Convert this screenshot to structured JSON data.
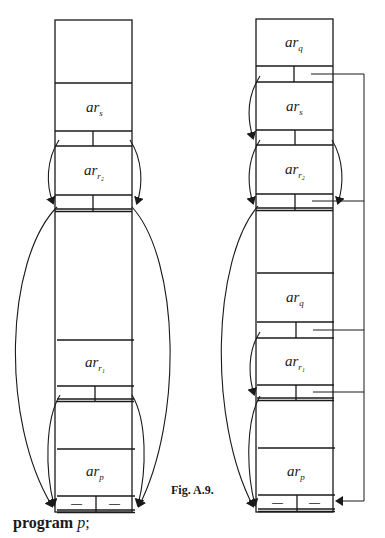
{
  "figure": {
    "caption": "Fig. A.9.",
    "program_keyword": "program",
    "program_name": "p",
    "program_terminator": ";"
  },
  "left_stack": {
    "frames": [
      {
        "label": "",
        "subscript": ""
      },
      {
        "label": "ar",
        "subscript": "s"
      },
      {
        "label": "ar",
        "subscript": "r₂"
      },
      {
        "label": "",
        "subscript": ""
      },
      {
        "label": "ar",
        "subscript": "r₁"
      },
      {
        "label": "",
        "subscript": ""
      },
      {
        "label": "ar",
        "subscript": "p"
      }
    ],
    "bottom_cells": [
      "—",
      "—"
    ]
  },
  "right_stack": {
    "frames": [
      {
        "label": "ar",
        "subscript": "q"
      },
      {
        "label": "ar",
        "subscript": "s"
      },
      {
        "label": "ar",
        "subscript": "r₂"
      },
      {
        "label": "",
        "subscript": ""
      },
      {
        "label": "ar",
        "subscript": "q"
      },
      {
        "label": "ar",
        "subscript": "r₁"
      },
      {
        "label": "",
        "subscript": ""
      },
      {
        "label": "ar",
        "subscript": "p"
      }
    ],
    "bottom_cells": [
      "—",
      "—"
    ]
  },
  "colors": {
    "ink": "#1a1a1a",
    "background": "#ffffff"
  }
}
